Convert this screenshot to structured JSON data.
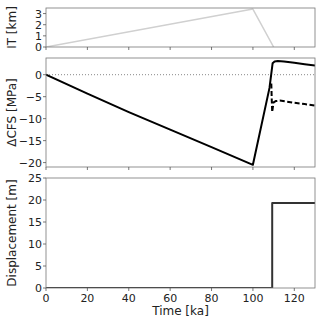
{
  "chart_data": [
    {
      "type": "line",
      "panel": "top",
      "ylabel": "IT [km]",
      "xlabel": "",
      "xlim": [
        0,
        130
      ],
      "ylim": [
        0,
        3.5
      ],
      "yticks": [
        0,
        1,
        2,
        3
      ],
      "xticks": [
        0,
        20,
        40,
        60,
        80,
        100,
        120
      ],
      "show_xticklabels": false,
      "grid": false,
      "series": [
        {
          "name": "IT",
          "color": "#d0d0d0",
          "style": "solid",
          "width": 1.5,
          "x": [
            0,
            100,
            110
          ],
          "y": [
            0,
            3.4,
            0
          ]
        }
      ]
    },
    {
      "type": "line",
      "panel": "middle",
      "ylabel": "ΔCFS [MPa]",
      "xlabel": "",
      "xlim": [
        0,
        130
      ],
      "ylim": [
        -21,
        3.8
      ],
      "yticks": [
        0,
        -5,
        -10,
        -15,
        -20
      ],
      "ytick_labels": [
        "0",
        "−5",
        "−10",
        "−15",
        "−20"
      ],
      "xticks": [
        0,
        20,
        40,
        60,
        80,
        100,
        120
      ],
      "show_xticklabels": false,
      "grid": false,
      "hline": {
        "y": 0,
        "style": "dotted",
        "color": "#888888"
      },
      "series": [
        {
          "name": "ΔCFS solid",
          "color": "#000000",
          "style": "solid",
          "width": 2,
          "x": [
            0,
            20,
            40,
            60,
            80,
            100,
            108,
            109.5,
            110.5,
            112,
            115,
            120,
            125,
            130
          ],
          "y": [
            0,
            -4.3,
            -8.5,
            -12.5,
            -16.5,
            -20.5,
            -3,
            2.6,
            3.0,
            3.1,
            3.0,
            2.7,
            2.4,
            2.1
          ]
        },
        {
          "name": "ΔCFS dashed",
          "color": "#000000",
          "style": "dashed",
          "width": 2,
          "x": [
            108.9,
            109.1,
            109.3,
            109.6,
            110,
            111,
            113,
            116,
            120,
            125,
            130
          ],
          "y": [
            -2,
            -6,
            -8.5,
            -7.5,
            -6.3,
            -6.0,
            -5.9,
            -6.1,
            -6.4,
            -6.7,
            -7.0
          ]
        }
      ]
    },
    {
      "type": "line",
      "panel": "bottom",
      "ylabel": "Displacement [m]",
      "xlabel": "Time [ka]",
      "xlim": [
        0,
        130
      ],
      "ylim": [
        0,
        25
      ],
      "yticks": [
        0,
        5,
        10,
        15,
        20,
        25
      ],
      "xticks": [
        0,
        20,
        40,
        60,
        80,
        100,
        120
      ],
      "show_xticklabels": true,
      "grid": false,
      "series": [
        {
          "name": "Displacement",
          "color": "#333333",
          "style": "solid",
          "width": 2,
          "x": [
            0,
            109.3,
            109.3,
            130
          ],
          "y": [
            0,
            0,
            19.3,
            19.3
          ]
        }
      ]
    }
  ],
  "layout": {
    "panels": [
      {
        "left": 46,
        "top": 8,
        "right": 315,
        "bottom": 47
      },
      {
        "left": 46,
        "top": 58,
        "right": 315,
        "bottom": 167
      },
      {
        "left": 46,
        "top": 178,
        "right": 315,
        "bottom": 288
      }
    ]
  }
}
